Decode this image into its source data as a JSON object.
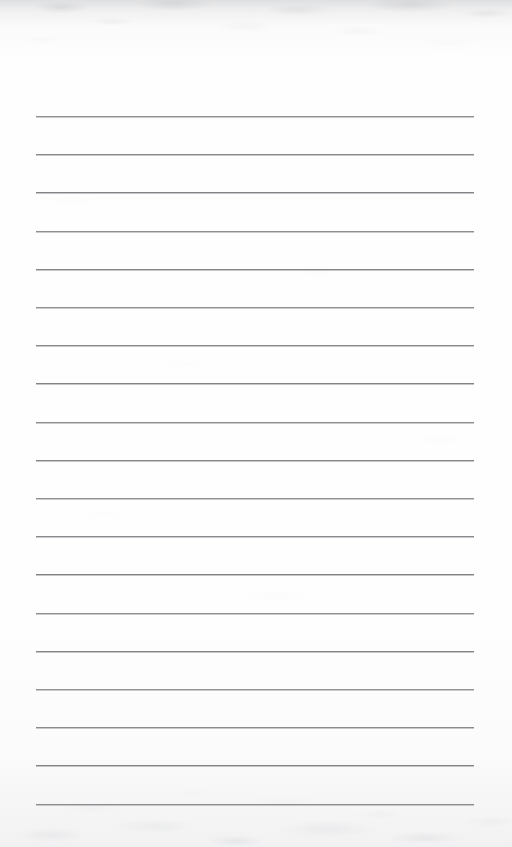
{
  "document": {
    "kind": "scanned-lined-paper",
    "title": "Blank Ruled Notebook Page",
    "orientation": "portrait",
    "page_width_px": 512,
    "page_height_px": 847,
    "has_visible_text": false,
    "text_content": "",
    "handwriting_present": false
  },
  "paper": {
    "background_color": "#fefefe",
    "edge_tint_color": "#b0b2b6",
    "grain_description": "faint grey mottling concentrated along top and bottom edges"
  },
  "ruling": {
    "line_color": "#7e8084",
    "line_thickness_px": 1,
    "line_count": 19,
    "left_x_px": 36,
    "right_x_px": 474,
    "line_length_px": 438,
    "first_line_y_px": 116,
    "last_line_y_px": 803,
    "line_spacing_px": 38.2,
    "margin_rule_present": false,
    "line_y_positions": [
      116,
      154.2,
      192.4,
      230.6,
      268.8,
      307,
      345.2,
      383.4,
      421.6,
      459.8,
      498,
      536.2,
      574.4,
      612.6,
      650.8,
      689,
      727.2,
      765.4,
      803.6
    ]
  }
}
